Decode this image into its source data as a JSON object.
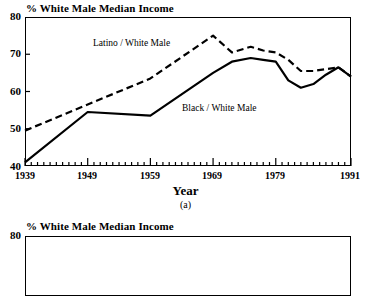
{
  "chart_data": [
    {
      "type": "line",
      "panel": "(a)",
      "title": "% White Male Median Income",
      "xlabel": "Year",
      "ylabel": "",
      "xlim": [
        1939,
        1991
      ],
      "ylim": [
        40,
        80
      ],
      "grid": false,
      "legend_position": "inline-annotation",
      "xticks": [
        1939,
        1949,
        1959,
        1969,
        1979,
        1991
      ],
      "xtick_labels": [
        "1939",
        "1949",
        "1959",
        "1969",
        "1979",
        "1991"
      ],
      "yticks": [
        40,
        50,
        60,
        70,
        80
      ],
      "ytick_labels": [
        "40",
        "50",
        "60",
        "70",
        "80"
      ],
      "minor_xtick_interval": 1,
      "series": [
        {
          "name": "Latino / White Male",
          "style": "dashed",
          "color": "#000000",
          "x": [
            1939,
            1949,
            1959,
            1969,
            1972,
            1975,
            1977,
            1979,
            1981,
            1983,
            1985,
            1987,
            1989,
            1991
          ],
          "values": [
            49.5,
            56.5,
            63.5,
            75.0,
            70.5,
            72.0,
            71.0,
            70.5,
            68.5,
            65.5,
            65.5,
            66.0,
            66.5,
            64.0
          ]
        },
        {
          "name": "Black / White Male",
          "style": "solid",
          "color": "#000000",
          "x": [
            1939,
            1949,
            1959,
            1969,
            1972,
            1975,
            1977,
            1979,
            1981,
            1983,
            1985,
            1987,
            1989,
            1991
          ],
          "values": [
            41.0,
            54.5,
            53.5,
            65.0,
            68.0,
            69.0,
            68.5,
            68.0,
            63.0,
            61.0,
            62.0,
            64.5,
            66.5,
            64.0
          ]
        }
      ],
      "annotations": [
        {
          "text": "Latino / White Male",
          "x": 1953,
          "y": 73
        },
        {
          "text": "Black / White Male",
          "x": 1968,
          "y": 57
        }
      ]
    },
    {
      "type": "line",
      "panel": "",
      "title": "% White Male Median Income",
      "xlabel": "",
      "ylabel": "",
      "ylim": [
        40,
        80
      ],
      "yticks": [
        80
      ],
      "ytick_labels": [
        "80"
      ],
      "series": [],
      "note": "second panel is cropped at the bottom edge of the screenshot"
    }
  ],
  "charts": {
    "a": {
      "title": "% White Male Median Income",
      "xaxis_title": "Year",
      "panel_label": "(a)",
      "ytick_labels": [
        "80",
        "70",
        "60",
        "50",
        "40"
      ],
      "xtick_labels": [
        "1939",
        "1949",
        "1959",
        "1969",
        "1979",
        "1991"
      ],
      "series_labels": {
        "latino": "Latino / White Male",
        "black": "Black / White Male"
      }
    },
    "b": {
      "title": "% White Male Median Income",
      "ytick_labels": [
        "80"
      ]
    }
  }
}
